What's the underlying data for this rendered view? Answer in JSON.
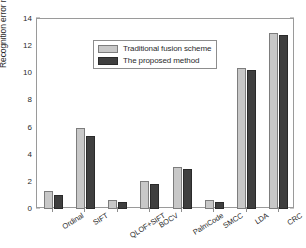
{
  "chart_data": {
    "type": "bar",
    "title": "",
    "xlabel": "",
    "ylabel": "Recognition error rate(%)",
    "ylim": [
      0,
      14
    ],
    "yticks": [
      0,
      2,
      4,
      6,
      8,
      10,
      12,
      14
    ],
    "grid": false,
    "legend_position": "upper-left-inside",
    "categories": [
      "Ordinal",
      "SIFT",
      "QLOF+SIFT",
      "BOCV",
      "PalmCode",
      "SMCC",
      "LDA",
      "CRC"
    ],
    "series": [
      {
        "name": "Traditional fusion scheme",
        "color": "#c8c8c8",
        "values": [
          1.3,
          5.95,
          0.65,
          2.1,
          3.1,
          0.65,
          10.4,
          13.0
        ]
      },
      {
        "name": "The proposed method",
        "color": "#3f3f3f",
        "values": [
          1.05,
          5.35,
          0.48,
          1.82,
          2.95,
          0.52,
          10.22,
          12.85
        ]
      }
    ]
  },
  "axes": {
    "frame_color": "#9a9a9a",
    "tick_color": "#8d8d8d",
    "text_color": "#2b2b2b"
  }
}
